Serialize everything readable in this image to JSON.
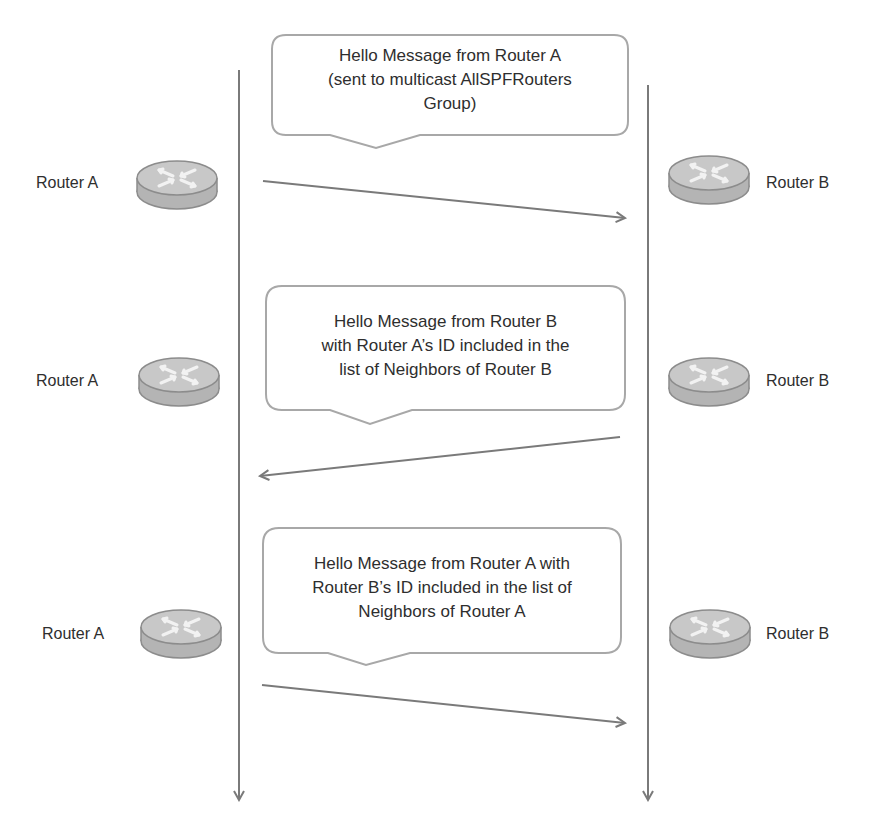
{
  "diagram": {
    "colors": {
      "line": "#7a7a7a",
      "router_fill": "#b8b8b8",
      "router_top": "#c9c9c9",
      "router_edge": "#8e8e8e",
      "callout_border": "#a8a8a8",
      "text": "#2e2e2e"
    },
    "lifelines": [
      {
        "name": "Router A",
        "x": 239,
        "y_start": 70,
        "y_end": 800
      },
      {
        "name": "Router B",
        "x": 648,
        "y_start": 85,
        "y_end": 800
      }
    ],
    "steps": [
      {
        "router_a_label": "Router A",
        "router_b_label": "Router B",
        "message": [
          "Hello Message from Router A",
          "(sent to multicast AllSPFRouters",
          "Group)"
        ],
        "direction": "A→B"
      },
      {
        "router_a_label": "Router A",
        "router_b_label": "Router B",
        "message": [
          "Hello Message from Router B",
          "with Router A’s ID included in the",
          "list of Neighbors of Router B"
        ],
        "direction": "B→A"
      },
      {
        "router_a_label": "Router A",
        "router_b_label": "Router B",
        "message": [
          "Hello Message from Router A with",
          "Router B’s ID included in the list of",
          "Neighbors of Router A"
        ],
        "direction": "A→B"
      }
    ],
    "icons": {
      "router": "router-icon"
    }
  }
}
